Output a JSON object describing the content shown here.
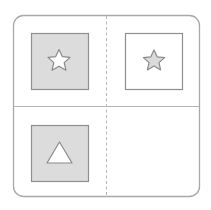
{
  "diagram": {
    "type": "2x2 figure matrix puzzle",
    "colors": {
      "frame": "#a8a8a8",
      "divider": "#b4b4b4",
      "shape_border": "#8f8f8f",
      "gray_fill": "#dcdcdc",
      "white_fill": "#ffffff"
    },
    "cells": [
      {
        "position": "top-left",
        "box_fill": "gray",
        "shape": "star",
        "shape_fill": "white"
      },
      {
        "position": "top-right",
        "box_fill": "white",
        "shape": "star",
        "shape_fill": "gray"
      },
      {
        "position": "bottom-left",
        "box_fill": "gray",
        "shape": "triangle",
        "shape_fill": "white"
      },
      {
        "position": "bottom-right",
        "box_fill": "none",
        "shape": "empty",
        "shape_fill": "none"
      }
    ],
    "dividers": {
      "vertical": "dashed",
      "horizontal": "solid"
    }
  }
}
